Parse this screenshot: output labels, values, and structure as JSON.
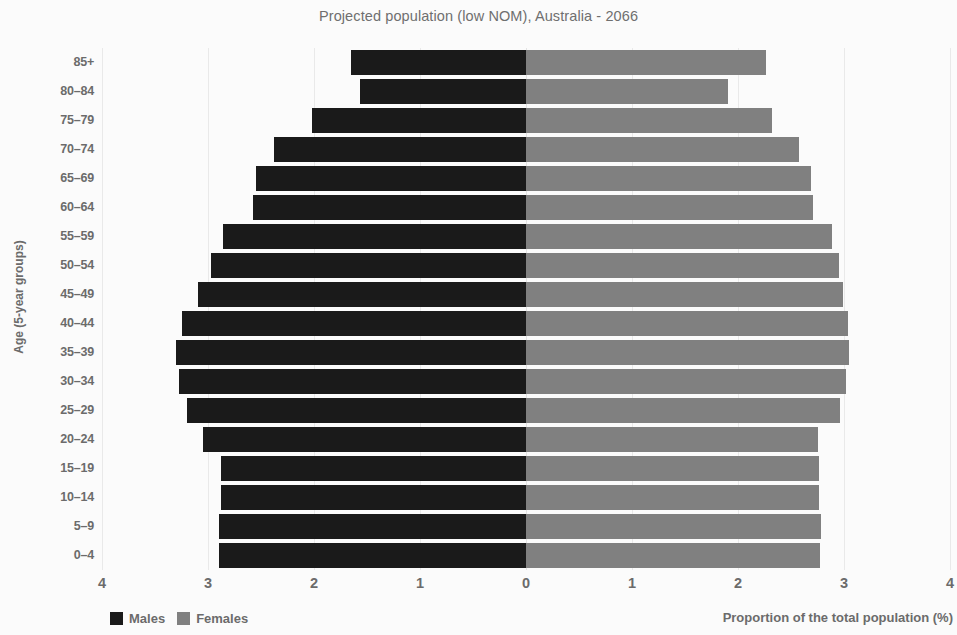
{
  "chart_data": {
    "type": "bar",
    "subtype": "population-pyramid",
    "title": "Projected population (low NOM), Australia - 2066",
    "xlabel": "Proportion of the total population (%)",
    "ylabel": "Age (5-year groups)",
    "xlim": [
      -4,
      4
    ],
    "xticks": [
      4,
      3,
      2,
      1,
      0,
      1,
      2,
      3,
      4
    ],
    "xtick_labels": [
      "4",
      "3",
      "2",
      "1",
      "0",
      "1",
      "2",
      "3",
      "4"
    ],
    "grid": true,
    "legend_position": "bottom-left",
    "categories": [
      "85+",
      "80–84",
      "75–79",
      "70–74",
      "65–69",
      "60–64",
      "55–59",
      "50–54",
      "45–49",
      "40–44",
      "35–39",
      "30–34",
      "25–29",
      "20–24",
      "15–19",
      "10–14",
      "5–9",
      "0–4"
    ],
    "series": [
      {
        "name": "Males",
        "color": "#1a1a1a",
        "direction": "left",
        "values": [
          1.65,
          1.57,
          2.02,
          2.38,
          2.55,
          2.58,
          2.86,
          2.97,
          3.09,
          3.25,
          3.3,
          3.27,
          3.2,
          3.05,
          2.88,
          2.88,
          2.9,
          2.9
        ]
      },
      {
        "name": "Females",
        "color": "#808080",
        "direction": "right",
        "values": [
          2.26,
          1.91,
          2.32,
          2.58,
          2.69,
          2.71,
          2.89,
          2.95,
          2.99,
          3.04,
          3.05,
          3.02,
          2.96,
          2.75,
          2.76,
          2.76,
          2.78,
          2.77
        ]
      }
    ]
  },
  "legend": {
    "items": [
      {
        "label": "Males",
        "color": "#1a1a1a",
        "swatch_name": "legend-swatch-males"
      },
      {
        "label": "Females",
        "color": "#808080",
        "swatch_name": "legend-swatch-females"
      }
    ]
  },
  "colors": {
    "males": "#1a1a1a",
    "females": "#808080",
    "text": "#6b6b6b",
    "grid": "#e9e9e9",
    "background": "#fbfbfb"
  }
}
